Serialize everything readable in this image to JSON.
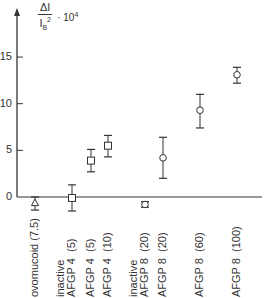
{
  "chart_data": {
    "type": "scatter",
    "title": "",
    "ylabel": "ΔI / I_B² · 10⁴",
    "ylabel_parts": {
      "num": "ΔI",
      "den": "I",
      "den_sub": "B",
      "den_sup": "2",
      "mult": "· 10",
      "mult_sup": "4"
    },
    "xlabel": "",
    "ylim": [
      -1.5,
      17
    ],
    "yticks": [
      0,
      5,
      10,
      15
    ],
    "ytick_labels": [
      "0",
      "5",
      "10",
      "15"
    ],
    "grid": false,
    "categories": [
      {
        "label": "ovomucoid (7.5)",
        "lines": [
          "ovomucoid (7.5)"
        ],
        "marker": "triangle",
        "value": -0.6,
        "err_low": -1.4,
        "err_high": 0.0,
        "x": 35
      },
      {
        "label": "inactive AFGP 4 (5)",
        "lines": [
          "inactive",
          "AFGP 4  (5)"
        ],
        "marker": "square",
        "value": -0.1,
        "err_low": -1.5,
        "err_high": 1.3,
        "x": 72
      },
      {
        "label": "AFGP 4 (5)",
        "lines": [
          "AFGP 4  (5)"
        ],
        "marker": "square",
        "value": 3.9,
        "err_low": 2.7,
        "err_high": 5.1,
        "x": 91
      },
      {
        "label": "AFGP 4 (10)",
        "lines": [
          "AFGP 4  (10)"
        ],
        "marker": "square",
        "value": 5.5,
        "err_low": 4.3,
        "err_high": 6.6,
        "x": 108
      },
      {
        "label": "inactive AFGP 8 (20)",
        "lines": [
          "inactive",
          "AFGP 8  (20)"
        ],
        "marker": "circle",
        "value": -0.8,
        "err_low": -1.1,
        "err_high": -0.5,
        "x": 145
      },
      {
        "label": "AFGP 8 (20)",
        "lines": [
          "AFGP 8  (20)"
        ],
        "marker": "circle",
        "value": 4.2,
        "err_low": 2.0,
        "err_high": 6.4,
        "x": 163
      },
      {
        "label": "AFGP 8 (60)",
        "lines": [
          "AFGP 8  (60)"
        ],
        "marker": "circle",
        "value": 9.3,
        "err_low": 7.4,
        "err_high": 11.0,
        "x": 200
      },
      {
        "label": "AFGP 8 (100)",
        "lines": [
          "AFGP 8  (100)"
        ],
        "marker": "circle",
        "value": 13.1,
        "err_low": 12.2,
        "err_high": 13.9,
        "x": 237
      }
    ],
    "colors": {
      "ink": "#333333",
      "background": "#ffffff"
    }
  }
}
